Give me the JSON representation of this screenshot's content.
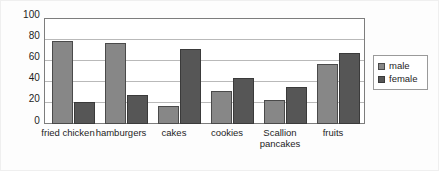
{
  "chart_data": {
    "type": "bar",
    "title": "",
    "xlabel": "",
    "ylabel": "",
    "ylim": [
      0,
      100
    ],
    "yticks": [
      0,
      20,
      40,
      60,
      80,
      100
    ],
    "grid": true,
    "legend_position": "right",
    "categories": [
      "fried chicken",
      "hamburgers",
      "cakes",
      "cookies",
      "Scallion\npancakes",
      "fruits"
    ],
    "series": [
      {
        "name": "male",
        "color": "#878787",
        "values": [
          78,
          76,
          17,
          31,
          23,
          57
        ]
      },
      {
        "name": "female",
        "color": "#565656",
        "values": [
          21,
          27,
          71,
          43,
          35,
          67
        ]
      }
    ]
  },
  "axis": {
    "y_tick_labels": [
      "100",
      "80",
      "60",
      "40",
      "20",
      "0"
    ]
  },
  "legend": {
    "items": [
      {
        "label": "male"
      },
      {
        "label": "female"
      }
    ]
  }
}
